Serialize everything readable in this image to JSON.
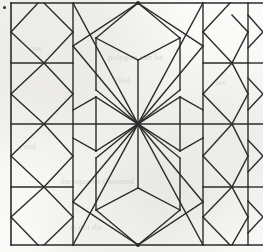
{
  "figure": {
    "kind": "geometric-line-diagram",
    "width": 263,
    "height": 252,
    "background_color": "#f7f7f4",
    "line_color": "#2b2b2b",
    "line_width": 1.3,
    "border_line_width": 1.6
  },
  "marks": {
    "corner_dot": {
      "x": 3,
      "y": 6,
      "label": "registration-dot"
    }
  },
  "ghost_text": [
    {
      "text": "polygon can be",
      "x": 108,
      "y": 52,
      "size": 9,
      "rotate": 0
    },
    {
      "text": "tiled",
      "x": 116,
      "y": 76,
      "size": 8,
      "rotate": 0
    },
    {
      "text": "the squares flattened",
      "x": 60,
      "y": 176,
      "size": 9,
      "rotate": 0
    },
    {
      "text": "is not the",
      "x": 70,
      "y": 222,
      "size": 9,
      "rotate": 0
    },
    {
      "text": "and",
      "x": 24,
      "y": 142,
      "size": 8,
      "rotate": 0
    },
    {
      "text": "one",
      "x": 30,
      "y": 44,
      "size": 8,
      "rotate": 0
    },
    {
      "text": "see",
      "x": 216,
      "y": 78,
      "size": 8,
      "rotate": 0
    }
  ],
  "chart_data": {
    "type": "diagram",
    "title": "",
    "grid": {
      "frame": {
        "left": 11,
        "top": 3,
        "right": 262,
        "bottom": 245
      },
      "vertical_lines": [
        11,
        73,
        203,
        248
      ],
      "horizontal_lines": [
        3,
        63,
        124,
        187,
        245
      ]
    },
    "key_points": {
      "center_convergence": [
        138,
        124
      ],
      "top_convergence": [
        138,
        3
      ],
      "bottom_convergence": [
        138,
        245
      ]
    },
    "segments": [
      {
        "name": "frame-left",
        "x1": 11,
        "y1": 3,
        "x2": 11,
        "y2": 245,
        "w": 1.6
      },
      {
        "name": "frame-top",
        "x1": 11,
        "y1": 3,
        "x2": 263,
        "y2": 3,
        "w": 1.6
      },
      {
        "name": "frame-bottom",
        "x1": 11,
        "y1": 245,
        "x2": 263,
        "y2": 245,
        "w": 1.6
      },
      {
        "name": "grid-v-73",
        "x1": 73,
        "y1": 3,
        "x2": 73,
        "y2": 245,
        "w": 1.4
      },
      {
        "name": "grid-v-203",
        "x1": 203,
        "y1": 3,
        "x2": 203,
        "y2": 245,
        "w": 1.4
      },
      {
        "name": "grid-v-248",
        "x1": 248,
        "y1": 3,
        "x2": 248,
        "y2": 245,
        "w": 1.4
      },
      {
        "name": "grid-h-63-a",
        "x1": 11,
        "y1": 63,
        "x2": 73,
        "y2": 63,
        "w": 1.4
      },
      {
        "name": "grid-h-63-b",
        "x1": 203,
        "y1": 63,
        "x2": 248,
        "y2": 63,
        "w": 1.4
      },
      {
        "name": "grid-h-63-c",
        "x1": 248,
        "y1": 63,
        "x2": 263,
        "y2": 63,
        "w": 1.4
      },
      {
        "name": "grid-h-187-a",
        "x1": 11,
        "y1": 187,
        "x2": 73,
        "y2": 187,
        "w": 1.4
      },
      {
        "name": "grid-h-187-b",
        "x1": 203,
        "y1": 187,
        "x2": 248,
        "y2": 187,
        "w": 1.4
      },
      {
        "name": "grid-h-187-c",
        "x1": 248,
        "y1": 187,
        "x2": 263,
        "y2": 187,
        "w": 1.4
      },
      {
        "name": "grid-h-124-a",
        "x1": 11,
        "y1": 124,
        "x2": 138,
        "y2": 124,
        "w": 1.4
      },
      {
        "name": "grid-h-124-b",
        "x1": 138,
        "y1": 124,
        "x2": 263,
        "y2": 124,
        "w": 1.4
      },
      {
        "name": "tl-oct-up",
        "x1": 11,
        "y1": 32,
        "x2": 38,
        "y2": 3,
        "w": 1.4
      },
      {
        "name": "tl-oct-dn",
        "x1": 11,
        "y1": 32,
        "x2": 44,
        "y2": 63,
        "w": 1.4
      },
      {
        "name": "tl-oct-r-up",
        "x1": 73,
        "y1": 32,
        "x2": 44,
        "y2": 3,
        "w": 1.4
      },
      {
        "name": "tl-oct-r-dn",
        "x1": 73,
        "y1": 32,
        "x2": 44,
        "y2": 63,
        "w": 1.4
      },
      {
        "name": "tl-v2-up",
        "x1": 11,
        "y1": 94,
        "x2": 44,
        "y2": 63,
        "w": 1.4
      },
      {
        "name": "tl-v2-dn",
        "x1": 11,
        "y1": 94,
        "x2": 44,
        "y2": 124,
        "w": 1.4
      },
      {
        "name": "tl-v2-r-up",
        "x1": 73,
        "y1": 94,
        "x2": 44,
        "y2": 63,
        "w": 1.4
      },
      {
        "name": "tl-v2-r-dn",
        "x1": 73,
        "y1": 94,
        "x2": 44,
        "y2": 124,
        "w": 1.4
      },
      {
        "name": "bl-v3-up",
        "x1": 11,
        "y1": 156,
        "x2": 44,
        "y2": 124,
        "w": 1.4
      },
      {
        "name": "bl-v3-dn",
        "x1": 11,
        "y1": 156,
        "x2": 44,
        "y2": 187,
        "w": 1.4
      },
      {
        "name": "bl-v3-r-up",
        "x1": 73,
        "y1": 156,
        "x2": 44,
        "y2": 124,
        "w": 1.4
      },
      {
        "name": "bl-v3-r-dn",
        "x1": 73,
        "y1": 156,
        "x2": 44,
        "y2": 187,
        "w": 1.4
      },
      {
        "name": "bl-v4-up",
        "x1": 11,
        "y1": 217,
        "x2": 44,
        "y2": 187,
        "w": 1.4
      },
      {
        "name": "bl-v4-dn",
        "x1": 11,
        "y1": 217,
        "x2": 38,
        "y2": 245,
        "w": 1.4
      },
      {
        "name": "bl-v4-r-up",
        "x1": 73,
        "y1": 217,
        "x2": 44,
        "y2": 187,
        "w": 1.4
      },
      {
        "name": "bl-v4-r-dn",
        "x1": 73,
        "y1": 217,
        "x2": 44,
        "y2": 245,
        "w": 1.4
      },
      {
        "name": "hex-t-left",
        "x1": 138,
        "y1": 3,
        "x2": 96,
        "y2": 38,
        "w": 1.4
      },
      {
        "name": "hex-t-right",
        "x1": 138,
        "y1": 3,
        "x2": 180,
        "y2": 38,
        "w": 1.4
      },
      {
        "name": "hex-l-up",
        "x1": 96,
        "y1": 38,
        "x2": 96,
        "y2": 90,
        "w": 1.4
      },
      {
        "name": "hex-r-up",
        "x1": 180,
        "y1": 38,
        "x2": 180,
        "y2": 90,
        "w": 1.4
      },
      {
        "name": "hex-l-low",
        "x1": 96,
        "y1": 90,
        "x2": 138,
        "y2": 124,
        "w": 1.4
      },
      {
        "name": "hex-r-low",
        "x1": 180,
        "y1": 90,
        "x2": 138,
        "y2": 124,
        "w": 1.4
      },
      {
        "name": "hex-mid-v-up",
        "x1": 138,
        "y1": 60,
        "x2": 138,
        "y2": 124,
        "w": 1.4
      },
      {
        "name": "hex-mid-l",
        "x1": 96,
        "y1": 38,
        "x2": 138,
        "y2": 60,
        "w": 1.4
      },
      {
        "name": "hex-mid-r",
        "x1": 180,
        "y1": 38,
        "x2": 138,
        "y2": 60,
        "w": 1.4
      },
      {
        "name": "hexb-l-up",
        "x1": 96,
        "y1": 210,
        "x2": 96,
        "y2": 158,
        "w": 1.4
      },
      {
        "name": "hexb-r-up",
        "x1": 180,
        "y1": 210,
        "x2": 180,
        "y2": 158,
        "w": 1.4
      },
      {
        "name": "hexb-l-hi",
        "x1": 96,
        "y1": 158,
        "x2": 138,
        "y2": 124,
        "w": 1.4
      },
      {
        "name": "hexb-r-hi",
        "x1": 180,
        "y1": 158,
        "x2": 138,
        "y2": 124,
        "w": 1.4
      },
      {
        "name": "hexb-b-left",
        "x1": 138,
        "y1": 245,
        "x2": 96,
        "y2": 210,
        "w": 1.4
      },
      {
        "name": "hexb-b-right",
        "x1": 138,
        "y1": 245,
        "x2": 180,
        "y2": 210,
        "w": 1.4
      },
      {
        "name": "hexb-mid-v",
        "x1": 138,
        "y1": 124,
        "x2": 138,
        "y2": 188,
        "w": 1.4
      },
      {
        "name": "hexb-mid-l",
        "x1": 96,
        "y1": 210,
        "x2": 138,
        "y2": 188,
        "w": 1.4
      },
      {
        "name": "hexb-mid-r",
        "x1": 180,
        "y1": 210,
        "x2": 138,
        "y2": 188,
        "w": 1.4
      },
      {
        "name": "diag-tl-long",
        "x1": 138,
        "y1": 3,
        "x2": 73,
        "y2": 46,
        "w": 1.4
      },
      {
        "name": "diag-tl-low",
        "x1": 73,
        "y1": 46,
        "x2": 138,
        "y2": 124,
        "w": 1.4
      },
      {
        "name": "diag-tr-long",
        "x1": 138,
        "y1": 3,
        "x2": 203,
        "y2": 46,
        "w": 1.4
      },
      {
        "name": "diag-tr-low",
        "x1": 203,
        "y1": 46,
        "x2": 138,
        "y2": 124,
        "w": 1.4
      },
      {
        "name": "diag-bl-long",
        "x1": 138,
        "y1": 245,
        "x2": 73,
        "y2": 202,
        "w": 1.4
      },
      {
        "name": "diag-bl-up",
        "x1": 73,
        "y1": 202,
        "x2": 138,
        "y2": 124,
        "w": 1.4
      },
      {
        "name": "diag-br-long",
        "x1": 138,
        "y1": 245,
        "x2": 203,
        "y2": 202,
        "w": 1.4
      },
      {
        "name": "diag-br-up",
        "x1": 203,
        "y1": 202,
        "x2": 138,
        "y2": 124,
        "w": 1.4
      },
      {
        "name": "x-tl-a",
        "x1": 73,
        "y1": 3,
        "x2": 138,
        "y2": 124,
        "w": 1.4
      },
      {
        "name": "x-tr-a",
        "x1": 203,
        "y1": 3,
        "x2": 138,
        "y2": 124,
        "w": 1.4
      },
      {
        "name": "x-bl-a",
        "x1": 73,
        "y1": 245,
        "x2": 138,
        "y2": 124,
        "w": 1.4
      },
      {
        "name": "x-br-a",
        "x1": 203,
        "y1": 245,
        "x2": 138,
        "y2": 124,
        "w": 1.4
      },
      {
        "name": "wing-l-up",
        "x1": 96,
        "y1": 97,
        "x2": 138,
        "y2": 124,
        "w": 1.4
      },
      {
        "name": "wing-l-dn",
        "x1": 96,
        "y1": 151,
        "x2": 138,
        "y2": 124,
        "w": 1.4
      },
      {
        "name": "wing-l-v",
        "x1": 96,
        "y1": 97,
        "x2": 96,
        "y2": 151,
        "w": 1.4
      },
      {
        "name": "wing-r-up",
        "x1": 180,
        "y1": 97,
        "x2": 138,
        "y2": 124,
        "w": 1.4
      },
      {
        "name": "wing-r-dn",
        "x1": 180,
        "y1": 151,
        "x2": 138,
        "y2": 124,
        "w": 1.4
      },
      {
        "name": "wing-r-v",
        "x1": 180,
        "y1": 97,
        "x2": 180,
        "y2": 151,
        "w": 1.4
      },
      {
        "name": "wing-l-out-u",
        "x1": 73,
        "y1": 110,
        "x2": 96,
        "y2": 97,
        "w": 1.4
      },
      {
        "name": "wing-l-out-d",
        "x1": 73,
        "y1": 138,
        "x2": 96,
        "y2": 151,
        "w": 1.4
      },
      {
        "name": "wing-r-out-u",
        "x1": 203,
        "y1": 110,
        "x2": 180,
        "y2": 97,
        "w": 1.4
      },
      {
        "name": "wing-r-out-d",
        "x1": 203,
        "y1": 138,
        "x2": 180,
        "y2": 151,
        "w": 1.4
      },
      {
        "name": "rt-oct-a-up",
        "x1": 203,
        "y1": 32,
        "x2": 230,
        "y2": 3,
        "w": 1.4
      },
      {
        "name": "rt-oct-a-dn",
        "x1": 203,
        "y1": 32,
        "x2": 232,
        "y2": 63,
        "w": 1.4
      },
      {
        "name": "rt-oct-b-up",
        "x1": 248,
        "y1": 32,
        "x2": 232,
        "y2": 15,
        "w": 1.4
      },
      {
        "name": "rt-oct-b-dn",
        "x1": 248,
        "y1": 32,
        "x2": 232,
        "y2": 63,
        "w": 1.4
      },
      {
        "name": "rt-oct-c-up",
        "x1": 248,
        "y1": 94,
        "x2": 232,
        "y2": 63,
        "w": 1.4
      },
      {
        "name": "rt-oct-c-dn",
        "x1": 248,
        "y1": 94,
        "x2": 232,
        "y2": 124,
        "w": 1.4
      },
      {
        "name": "rt-oct-d-up",
        "x1": 203,
        "y1": 94,
        "x2": 232,
        "y2": 63,
        "w": 1.4
      },
      {
        "name": "rt-oct-d-dn",
        "x1": 203,
        "y1": 94,
        "x2": 232,
        "y2": 124,
        "w": 1.4
      },
      {
        "name": "rt-oct-e-up",
        "x1": 248,
        "y1": 156,
        "x2": 232,
        "y2": 124,
        "w": 1.4
      },
      {
        "name": "rt-oct-e-dn",
        "x1": 248,
        "y1": 156,
        "x2": 232,
        "y2": 187,
        "w": 1.4
      },
      {
        "name": "rt-oct-f-up",
        "x1": 203,
        "y1": 156,
        "x2": 232,
        "y2": 124,
        "w": 1.4
      },
      {
        "name": "rt-oct-f-dn",
        "x1": 203,
        "y1": 156,
        "x2": 232,
        "y2": 187,
        "w": 1.4
      },
      {
        "name": "rt-oct-g-up",
        "x1": 248,
        "y1": 217,
        "x2": 232,
        "y2": 187,
        "w": 1.4
      },
      {
        "name": "rt-oct-g-dn",
        "x1": 248,
        "y1": 217,
        "x2": 232,
        "y2": 245,
        "w": 1.4
      },
      {
        "name": "rt-oct-h-up",
        "x1": 203,
        "y1": 217,
        "x2": 232,
        "y2": 187,
        "w": 1.4
      },
      {
        "name": "rt-oct-h-dn",
        "x1": 203,
        "y1": 217,
        "x2": 230,
        "y2": 245,
        "w": 1.4
      },
      {
        "name": "far-r-a-up",
        "x1": 263,
        "y1": 32,
        "x2": 248,
        "y2": 15,
        "w": 1.4
      },
      {
        "name": "far-r-a-dn",
        "x1": 263,
        "y1": 32,
        "x2": 248,
        "y2": 48,
        "w": 1.4
      },
      {
        "name": "far-r-b-up",
        "x1": 263,
        "y1": 94,
        "x2": 248,
        "y2": 78,
        "w": 1.4
      },
      {
        "name": "far-r-b-dn",
        "x1": 263,
        "y1": 94,
        "x2": 248,
        "y2": 110,
        "w": 1.4
      },
      {
        "name": "far-r-c-up",
        "x1": 263,
        "y1": 156,
        "x2": 248,
        "y2": 140,
        "w": 1.4
      },
      {
        "name": "far-r-c-dn",
        "x1": 263,
        "y1": 156,
        "x2": 248,
        "y2": 172,
        "w": 1.4
      },
      {
        "name": "far-r-d-up",
        "x1": 263,
        "y1": 217,
        "x2": 248,
        "y2": 201,
        "w": 1.4
      },
      {
        "name": "far-r-d-dn",
        "x1": 263,
        "y1": 217,
        "x2": 248,
        "y2": 233,
        "w": 1.4
      }
    ]
  }
}
